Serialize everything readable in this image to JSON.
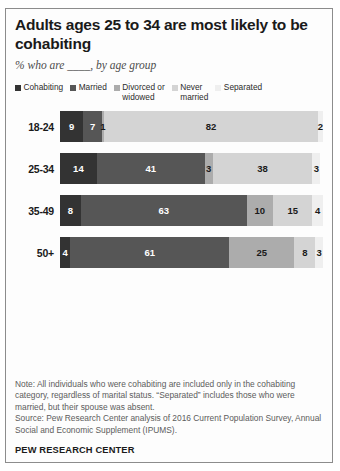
{
  "figure": {
    "title": "Adults ages 25 to 34 are most likely to be cohabiting",
    "subtitle": "% who are ____, by age group",
    "note": "Note: All individuals who were cohabiting are included only in the cohabiting category, regardless of marital status. “Separated” includes those who were married, but their spouse was absent.",
    "source": "Source: Pew Research Center analysis of 2016 Current Population Survey, Annual Social and Economic Supplement (IPUMS).",
    "brand": "PEW RESEARCH CENTER"
  },
  "chart_data": {
    "type": "bar",
    "orientation": "horizontal",
    "stacked": true,
    "title": "Adults ages 25 to 34 are most likely to be cohabiting",
    "subtitle": "% who are ____, by age group",
    "xlabel": "",
    "ylabel": "",
    "xlim": [
      0,
      100
    ],
    "grid": false,
    "legend_position": "top",
    "categories": [
      "18-24",
      "25-34",
      "35-49",
      "50+"
    ],
    "series": [
      {
        "name": "Cohabiting",
        "color": "#333333",
        "label_color": "#ffffff",
        "values": [
          9,
          14,
          8,
          4
        ]
      },
      {
        "name": "Married",
        "color": "#565656",
        "label_color": "#ffffff",
        "values": [
          7,
          41,
          63,
          61
        ]
      },
      {
        "name": "Divorced or widowed",
        "color": "#acacac",
        "label_color": "#1a1a1a",
        "values": [
          1,
          3,
          10,
          25
        ]
      },
      {
        "name": "Never married",
        "color": "#d4d4d4",
        "label_color": "#1a1a1a",
        "values": [
          82,
          38,
          15,
          8
        ]
      },
      {
        "name": "Separated",
        "color": "#efefef",
        "label_color": "#1a1a1a",
        "values": [
          2,
          3,
          4,
          3
        ]
      }
    ]
  }
}
